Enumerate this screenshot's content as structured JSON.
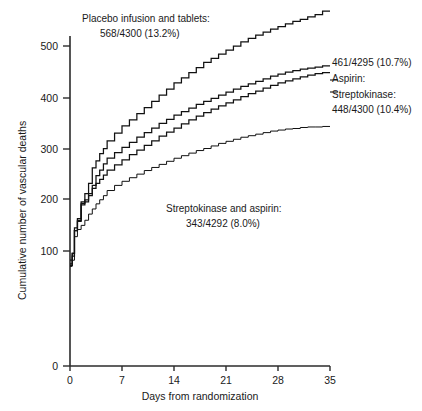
{
  "chart_data": {
    "type": "line",
    "title": "",
    "xlabel": "Days from randomization",
    "ylabel": "Cumulative number of vascular deaths",
    "xlim": [
      0,
      35
    ],
    "ylim": [
      0,
      540
    ],
    "xticks": [
      "0",
      "7",
      "14",
      "21",
      "28",
      "35"
    ],
    "yticks": [
      "0",
      "100",
      "200",
      "300",
      "400",
      "500"
    ],
    "grid": false,
    "legend_position": "inline-annotations",
    "step_style": "step-after",
    "series": [
      {
        "name": "Placebo infusion and tablets",
        "deaths": 568,
        "total": 4300,
        "percent": "13.2%",
        "label_line1": "Placebo infusion and tablets:",
        "label_line2": "568/4300 (13.2%)",
        "x": [
          0,
          0.3,
          0.6,
          1,
          1.5,
          2,
          2.5,
          3,
          3.5,
          4,
          4.5,
          5,
          6,
          7,
          8,
          9,
          10,
          11,
          12,
          13,
          14,
          15,
          16,
          17,
          18,
          19,
          20,
          21,
          22,
          23,
          24,
          25,
          26,
          27,
          28,
          29,
          30,
          31,
          32,
          33,
          34,
          35
        ],
        "y": [
          0,
          72,
          95,
          140,
          163,
          196,
          212,
          232,
          262,
          276,
          290,
          300,
          315,
          330,
          344,
          356,
          368,
          380,
          392,
          404,
          416,
          428,
          438,
          448,
          458,
          468,
          476,
          484,
          492,
          500,
          508,
          515,
          521,
          527,
          533,
          538,
          543,
          548,
          552,
          557,
          561,
          568
        ]
      },
      {
        "name": "Aspirin",
        "deaths": 461,
        "total": 4295,
        "percent": "10.7%",
        "label_line1": "461/4295 (10.7%)",
        "label_line2": "Aspirin:",
        "x": [
          0,
          0.3,
          0.6,
          1,
          1.5,
          2,
          2.5,
          3,
          3.5,
          4,
          4.5,
          5,
          6,
          7,
          8,
          9,
          10,
          11,
          12,
          13,
          14,
          15,
          16,
          17,
          18,
          19,
          20,
          21,
          22,
          23,
          24,
          25,
          26,
          27,
          28,
          29,
          30,
          31,
          32,
          33,
          34,
          35
        ],
        "y": [
          0,
          75,
          90,
          140,
          158,
          190,
          196,
          208,
          228,
          247,
          258,
          270,
          281,
          292,
          302,
          312,
          322,
          331,
          340,
          349,
          357,
          365,
          372,
          379,
          386,
          392,
          398,
          404,
          410,
          416,
          421,
          426,
          431,
          436,
          441,
          445,
          449,
          452,
          455,
          457,
          459,
          461
        ]
      },
      {
        "name": "Streptokinase",
        "deaths": 448,
        "total": 4300,
        "percent": "10.4%",
        "label_line1": "Streptokinase:",
        "label_line2": "448/4300 (10.4%)",
        "x": [
          0,
          0.3,
          0.6,
          1,
          1.5,
          2,
          2.5,
          3,
          3.5,
          4,
          4.5,
          5,
          6,
          7,
          8,
          9,
          10,
          11,
          12,
          13,
          14,
          15,
          16,
          17,
          18,
          19,
          20,
          21,
          22,
          23,
          24,
          25,
          26,
          27,
          28,
          29,
          30,
          31,
          32,
          33,
          34,
          35
        ],
        "y": [
          0,
          82,
          96,
          145,
          160,
          193,
          200,
          212,
          222,
          232,
          240,
          248,
          258,
          268,
          278,
          288,
          297,
          306,
          315,
          324,
          332,
          340,
          348,
          356,
          363,
          370,
          377,
          383,
          389,
          395,
          401,
          407,
          412,
          418,
          423,
          428,
          432,
          436,
          440,
          443,
          446,
          448
        ]
      },
      {
        "name": "Streptokinase and aspirin",
        "deaths": 343,
        "total": 4292,
        "percent": "8.0%",
        "label_line1": "Streptokinase and aspirin:",
        "label_line2": "343/4292 (8.0%)",
        "x": [
          0,
          0.3,
          0.6,
          1,
          1.5,
          2,
          2.5,
          3,
          3.5,
          4,
          4.5,
          5,
          6,
          7,
          8,
          9,
          10,
          11,
          12,
          13,
          14,
          15,
          16,
          17,
          18,
          19,
          20,
          21,
          22,
          23,
          24,
          25,
          26,
          27,
          28,
          29,
          30,
          31,
          32,
          33,
          34,
          35
        ],
        "y": [
          0,
          70,
          82,
          128,
          142,
          150,
          160,
          172,
          182,
          192,
          200,
          208,
          218,
          228,
          236,
          243,
          250,
          257,
          263,
          269,
          275,
          281,
          286,
          291,
          296,
          300,
          305,
          310,
          314,
          318,
          322,
          325,
          328,
          331,
          334,
          336,
          338,
          339,
          341,
          342,
          342,
          343
        ]
      }
    ]
  },
  "annotations": {
    "placebo": {
      "line1": "Placebo infusion and tablets:",
      "line2": "568/4300 (13.2%)"
    },
    "right": {
      "line1": "461/4295 (10.7%)",
      "line2": "Aspirin:",
      "line3": "Streptokinase:",
      "line4": "448/4300 (10.4%)"
    },
    "combined": {
      "line1": "Streptokinase and aspirin:",
      "line2": "343/4292 (8.0%)"
    }
  },
  "axes": {
    "y_title": "Cumulative number of vascular deaths",
    "x_title": "Days from randomization",
    "y_ticks": [
      "500",
      "400",
      "300",
      "200",
      "100",
      "0"
    ],
    "x_ticks": [
      "0",
      "7",
      "14",
      "21",
      "28",
      "35"
    ]
  }
}
